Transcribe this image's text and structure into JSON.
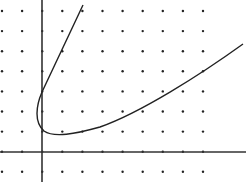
{
  "diagram": {
    "type": "dot-grid graph with curve",
    "background": "#ffffff",
    "ink_color": "#222222",
    "dot_grid": {
      "x_start": 2,
      "x_step": 20.1,
      "cols": 11,
      "y_start": 11,
      "y_step": 20.1,
      "rows": 9
    },
    "axes": {
      "y_axis_x": 42,
      "x_axis_y": 152,
      "y_axis_range": [
        0,
        182
      ],
      "x_axis_range": [
        0,
        246
      ]
    },
    "curve": {
      "description": "hyperbola-like curve: steep upper-left branch and gently rising right branch joined by a turn near the origin",
      "path": "M 83 5 L 42 92 C 36 106 34 122 44 131 C 54 138 75 134 100 127 C 140 113 200 75 243 44"
    }
  }
}
